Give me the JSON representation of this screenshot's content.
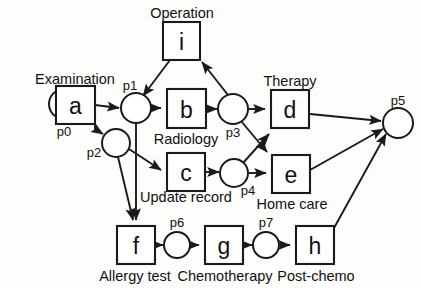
{
  "diagram": {
    "type": "petri-net",
    "colors": {
      "stroke": "#1a1a1a",
      "fill": "#ffffff",
      "background": "#fdfdfc"
    },
    "places": [
      {
        "id": "p0",
        "label": "p0",
        "cx": 64,
        "cy": 104,
        "r": 15,
        "tokens": 1,
        "label_x": 64,
        "label_y": 131
      },
      {
        "id": "p1",
        "label": "p1",
        "cx": 136,
        "cy": 108,
        "r": 15,
        "tokens": 0,
        "label_x": 130,
        "label_y": 85
      },
      {
        "id": "p2",
        "label": "p2",
        "cx": 116,
        "cy": 143,
        "r": 14,
        "tokens": 0,
        "label_x": 94,
        "label_y": 152
      },
      {
        "id": "p3",
        "label": "p3",
        "cx": 233,
        "cy": 109,
        "r": 15,
        "tokens": 0,
        "label_x": 233,
        "label_y": 132
      },
      {
        "id": "p4",
        "label": "p4",
        "cx": 234,
        "cy": 173,
        "r": 14,
        "tokens": 0,
        "label_x": 248,
        "label_y": 190
      },
      {
        "id": "p5",
        "label": "p5",
        "cx": 398,
        "cy": 123,
        "r": 15,
        "tokens": 0,
        "label_x": 398,
        "label_y": 100
      },
      {
        "id": "p6",
        "label": "p6",
        "cx": 177,
        "cy": 245,
        "r": 13,
        "tokens": 0,
        "label_x": 177,
        "label_y": 222
      },
      {
        "id": "p7",
        "label": "p7",
        "cx": 266,
        "cy": 245,
        "r": 13,
        "tokens": 0,
        "label_x": 266,
        "label_y": 222
      }
    ],
    "transitions": [
      {
        "id": "a",
        "label": "a",
        "name": "Examination",
        "x": 56,
        "y": 86,
        "w": 39,
        "h": 38,
        "name_x": 75,
        "name_y": 79
      },
      {
        "id": "b",
        "label": "b",
        "name": "Radiology",
        "x": 167,
        "y": 89,
        "w": 39,
        "h": 39,
        "name_x": 186,
        "name_y": 139
      },
      {
        "id": "c",
        "label": "c",
        "name": "Update record",
        "x": 167,
        "y": 153,
        "w": 38,
        "h": 38,
        "name_x": 186,
        "name_y": 197
      },
      {
        "id": "d",
        "label": "d",
        "name": "Therapy",
        "x": 271,
        "y": 90,
        "w": 38,
        "h": 38,
        "name_x": 290,
        "name_y": 81
      },
      {
        "id": "e",
        "label": "e",
        "name": "Home care",
        "x": 272,
        "y": 155,
        "w": 38,
        "h": 38,
        "name_x": 292,
        "name_y": 204
      },
      {
        "id": "f",
        "label": "f",
        "name": "Allergy test",
        "x": 117,
        "y": 226,
        "w": 38,
        "h": 38,
        "name_x": 135,
        "name_y": 276
      },
      {
        "id": "g",
        "label": "g",
        "name": "Chemotherapy",
        "x": 205,
        "y": 226,
        "w": 38,
        "h": 38,
        "name_x": 225,
        "name_y": 276
      },
      {
        "id": "h",
        "label": "h",
        "name": "Post-chemo",
        "x": 296,
        "y": 226,
        "w": 38,
        "h": 38,
        "name_x": 316,
        "name_y": 276
      },
      {
        "id": "i",
        "label": "i",
        "name": "Operation",
        "x": 163,
        "y": 22,
        "w": 37,
        "h": 38,
        "name_x": 182,
        "name_y": 13
      }
    ],
    "arcs": [
      {
        "from": "p0",
        "to": "a",
        "path": "M 80,104 L 50,104"
      },
      {
        "from": "a",
        "to": "p1",
        "path": "M 95,105 L 119,108"
      },
      {
        "from": "a",
        "to": "p2",
        "path": "M 95,120 L 95,129 L 103,134"
      },
      {
        "from": "p1",
        "to": "b",
        "path": "M 152,108 L 161,108"
      },
      {
        "from": "p1",
        "to": "f",
        "path": "M 136,123 L 136,220"
      },
      {
        "from": "p2",
        "to": "c",
        "path": "M 129,149 L 161,170"
      },
      {
        "from": "p2",
        "to": "f",
        "path": "M 118,157 L 133,220"
      },
      {
        "from": "b",
        "to": "p3",
        "path": "M 206,109 L 217,109"
      },
      {
        "from": "c",
        "to": "p4",
        "path": "M 205,172 L 219,172"
      },
      {
        "from": "p3",
        "to": "i",
        "path": "M 228,95 L 202,62"
      },
      {
        "from": "i",
        "to": "p1",
        "path": "M 170,60 L 143,96"
      },
      {
        "from": "p3",
        "to": "d",
        "path": "M 249,109 L 265,109"
      },
      {
        "from": "p3",
        "to": "e",
        "path": "M 241,121 L 267,152"
      },
      {
        "from": "p4",
        "to": "e",
        "path": "M 249,173 L 266,173"
      },
      {
        "from": "p4",
        "to": "d",
        "path": "M 243,163 L 269,134"
      },
      {
        "from": "d",
        "to": "p5",
        "path": "M 310,114 L 381,121"
      },
      {
        "from": "e",
        "to": "p5",
        "path": "M 310,170 L 383,129"
      },
      {
        "from": "f",
        "to": "p6",
        "path": "M 155,245 L 163,245"
      },
      {
        "from": "p6",
        "to": "g",
        "path": "M 190,245 L 199,245"
      },
      {
        "from": "g",
        "to": "p7",
        "path": "M 243,245 L 252,245"
      },
      {
        "from": "p7",
        "to": "h",
        "path": "M 279,245 L 290,245"
      },
      {
        "from": "h",
        "to": "p5",
        "path": "M 334,228 L 386,134"
      }
    ]
  }
}
